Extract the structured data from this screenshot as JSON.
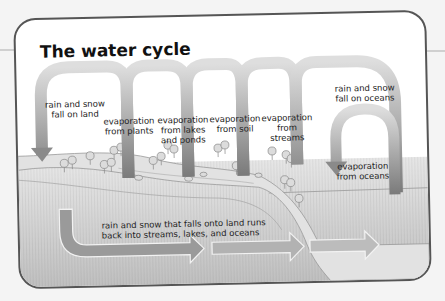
{
  "title": "The water cycle",
  "labels": {
    "rain_land": [
      "rain and snow",
      "fall on land"
    ],
    "evap_plants": [
      "evaporation",
      "from plants"
    ],
    "evap_lakes": [
      "evaporation",
      "from lakes",
      "and ponds"
    ],
    "evap_soil": [
      "evaporation",
      "from soil"
    ],
    "evap_streams": [
      "evaporation",
      "from",
      "streams"
    ],
    "rain_oceans": [
      "rain and snow",
      "fall on oceans"
    ],
    "evap_oceans": [
      "evaporation",
      "from oceans"
    ],
    "runoff": [
      "rain and snow that falls onto land runs",
      "back into streams, lakes, and oceans"
    ]
  },
  "colors": {
    "arrow_dark": "#7a7a7a",
    "arrow_light": "#d8d8d8",
    "water": "#c8c8c8",
    "land": "#dcdcdc",
    "border": "#555555"
  },
  "icons": {
    "arrows": "flow-arrows",
    "trees": "tree-icons"
  }
}
